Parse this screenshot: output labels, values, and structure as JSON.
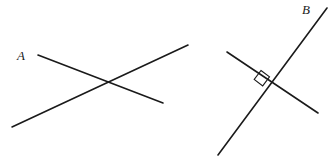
{
  "figure": {
    "background_color": "#ffffff",
    "line_color": "#1a1a1a",
    "width": 335,
    "height": 163,
    "parts": [
      {
        "id": "figure-a",
        "label": "A",
        "label_x": 17,
        "label_y": 49,
        "description": "two lines crossing at an oblique angle",
        "has_right_angle_mark": false,
        "lines": [
          {
            "name": "line-a-descending",
            "x1": 38,
            "y1": 55,
            "x2": 163,
            "y2": 103
          },
          {
            "name": "line-a-ascending",
            "x1": 12,
            "y1": 127,
            "x2": 188,
            "y2": 45
          }
        ],
        "intersection": {
          "x": 103,
          "y": 85
        }
      },
      {
        "id": "figure-b",
        "label": "B",
        "label_x": 302,
        "label_y": 3,
        "description": "two lines crossing at a right angle",
        "has_right_angle_mark": true,
        "lines": [
          {
            "name": "line-b-shallow-descending",
            "x1": 227,
            "y1": 52,
            "x2": 318,
            "y2": 113
          },
          {
            "name": "line-b-steep-ascending",
            "x1": 218,
            "y1": 155,
            "x2": 327,
            "y2": 8
          }
        ],
        "intersection": {
          "x": 270,
          "y": 83
        },
        "right_angle_mark": {
          "name": "right-angle-square",
          "points": "261.0,70.5 269.5,76.9 262.7,85.9 254.2,79.5",
          "size_px": 11
        }
      }
    ]
  }
}
